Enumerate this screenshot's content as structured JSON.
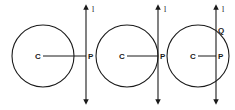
{
  "diagram": {
    "stroke_color": "#1a1a1a",
    "background": "#ffffff",
    "panels": [
      {
        "id": "non-intersecting",
        "circle": {
          "cx": 43,
          "cy": 56,
          "r": 31
        },
        "center_label": "C",
        "center_label_pos": [
          35,
          59
        ],
        "radius_end": [
          86,
          56
        ],
        "line": {
          "x": 86,
          "y1": 7,
          "y2": 102
        },
        "line_label": "l",
        "line_label_pos": [
          92,
          12
        ],
        "point_label": "P",
        "point_label_pos": [
          88,
          59
        ],
        "extra_points": []
      },
      {
        "id": "tangent",
        "circle": {
          "cx": 127,
          "cy": 56,
          "r": 31
        },
        "center_label": "C",
        "center_label_pos": [
          119,
          59
        ],
        "radius_end": [
          158,
          56
        ],
        "line": {
          "x": 158,
          "y1": 7,
          "y2": 102
        },
        "line_label": "l",
        "line_label_pos": [
          164,
          12
        ],
        "point_label": "P",
        "point_label_pos": [
          160,
          59
        ],
        "extra_points": []
      },
      {
        "id": "secant",
        "circle": {
          "cx": 198,
          "cy": 56,
          "r": 31
        },
        "center_label": "C",
        "center_label_pos": [
          190,
          59
        ],
        "radius_end": [
          216,
          56
        ],
        "line": {
          "x": 216,
          "y1": 7,
          "y2": 102
        },
        "line_label": "l",
        "line_label_pos": [
          222,
          12
        ],
        "point_label": "P",
        "point_label_pos": [
          218,
          59
        ],
        "extra_points": [
          {
            "label": "Q",
            "pos": [
              218,
              33
            ]
          }
        ]
      }
    ]
  }
}
